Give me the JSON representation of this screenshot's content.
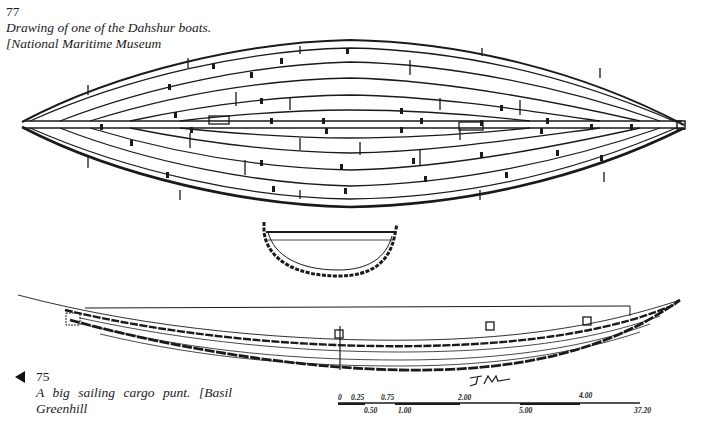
{
  "figure_77": {
    "number": "77",
    "caption_line1": "Drawing of one of the Dahshur boats.",
    "caption_line2": "[National Maritime Museum",
    "drawing": "plan-view-dahshur-boat",
    "cross_section": "boat-cross-section"
  },
  "figure_75": {
    "pointer": "◀",
    "number": "75",
    "caption": "A big sailing cargo punt. [Basil Greenhill",
    "drawing": "side-elevation-cargo-punt",
    "signature": "JM"
  },
  "scale_bar": {
    "top_labels": [
      "0",
      "0.25",
      "0.75",
      "2.00",
      "4.00"
    ],
    "bottom_labels": [
      "0.50",
      "1.00",
      "3.00",
      "5.00",
      "37.20"
    ]
  },
  "colors": {
    "ink": "#1a1a1a",
    "paper": "#ffffff"
  }
}
